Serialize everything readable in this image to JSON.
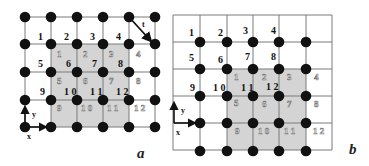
{
  "figure": {
    "panels": [
      {
        "id": "a",
        "label": "a",
        "grid_lines": {
          "x": [
            25,
            51,
            77,
            103,
            129,
            155
          ],
          "y": [
            17,
            44,
            72,
            100,
            127
          ]
        },
        "shaded_region": {
          "x0": 51,
          "y0": 44,
          "x1": 129,
          "y1": 127
        },
        "dots": {
          "x": [
            25,
            51,
            77,
            103,
            129,
            155
          ],
          "y": [
            17,
            44,
            72,
            100,
            127
          ]
        },
        "black_labels": [
          {
            "text": "1",
            "x": 38,
            "y": 40
          },
          {
            "text": "2",
            "x": 64,
            "y": 40
          },
          {
            "text": "3",
            "x": 90,
            "y": 40
          },
          {
            "text": "4",
            "x": 116,
            "y": 40
          },
          {
            "text": "5",
            "x": 38,
            "y": 67
          },
          {
            "text": "6",
            "x": 66,
            "y": 67
          },
          {
            "text": "7",
            "x": 92,
            "y": 67
          },
          {
            "text": "8",
            "x": 118,
            "y": 67
          },
          {
            "text": "9",
            "x": 40,
            "y": 95
          },
          {
            "text": "1 0",
            "x": 64,
            "y": 95
          },
          {
            "text": "1 1",
            "x": 90,
            "y": 95
          },
          {
            "text": "1 2",
            "x": 116,
            "y": 95
          }
        ],
        "gray_labels": [
          {
            "text": "1",
            "x": 57,
            "y": 57
          },
          {
            "text": "2",
            "x": 83,
            "y": 57
          },
          {
            "text": "3",
            "x": 109,
            "y": 57
          },
          {
            "text": "4",
            "x": 136,
            "y": 57
          },
          {
            "text": "5",
            "x": 57,
            "y": 84
          },
          {
            "text": "6",
            "x": 83,
            "y": 84
          },
          {
            "text": "7",
            "x": 109,
            "y": 84
          },
          {
            "text": "8",
            "x": 136,
            "y": 84
          },
          {
            "text": "9",
            "x": 57,
            "y": 111
          },
          {
            "text": "1 0",
            "x": 81,
            "y": 111
          },
          {
            "text": "1 1",
            "x": 107,
            "y": 111
          },
          {
            "text": "1 2",
            "x": 134,
            "y": 111
          }
        ],
        "translation_arrow": {
          "label": "t",
          "from": [
            129,
            17
          ],
          "to": [
            150,
            40
          ],
          "label_pos": [
            142,
            27
          ]
        },
        "axes": {
          "origin": [
            25,
            127
          ],
          "x_label": "x",
          "y_label": "y"
        },
        "panel_label_pos": [
          137,
          158
        ]
      },
      {
        "id": "b",
        "label": "b",
        "frame": {
          "x0": 173,
          "y0": 15,
          "x1": 332,
          "y1": 150
        },
        "grid_lines": {
          "x": [
            173,
            200,
            227,
            253,
            279,
            306,
            332
          ],
          "y": [
            15,
            42,
            69,
            96,
            123,
            150
          ]
        },
        "shaded_region": {
          "x0": 227,
          "y0": 69,
          "x1": 306,
          "y1": 150
        },
        "dots": {
          "x": [
            200,
            227,
            253,
            279,
            306
          ],
          "y": [
            42,
            69,
            96,
            123,
            151
          ]
        },
        "black_labels": [
          {
            "text": "1",
            "x": 189,
            "y": 36
          },
          {
            "text": "2",
            "x": 218,
            "y": 36
          },
          {
            "text": "3",
            "x": 243,
            "y": 34
          },
          {
            "text": "4",
            "x": 271,
            "y": 34
          },
          {
            "text": "5",
            "x": 189,
            "y": 61
          },
          {
            "text": "6",
            "x": 218,
            "y": 63
          },
          {
            "text": "7",
            "x": 245,
            "y": 60
          },
          {
            "text": "8",
            "x": 271,
            "y": 60
          },
          {
            "text": "9",
            "x": 190,
            "y": 91
          },
          {
            "text": "1 0",
            "x": 213,
            "y": 91
          },
          {
            "text": "1 1",
            "x": 241,
            "y": 91
          },
          {
            "text": "1 2",
            "x": 266,
            "y": 90
          }
        ],
        "gray_labels": [
          {
            "text": "1",
            "x": 234,
            "y": 80
          },
          {
            "text": "2",
            "x": 262,
            "y": 80
          },
          {
            "text": "3",
            "x": 287,
            "y": 80
          },
          {
            "text": "4",
            "x": 314,
            "y": 80
          },
          {
            "text": "5",
            "x": 234,
            "y": 106
          },
          {
            "text": "6",
            "x": 262,
            "y": 107
          },
          {
            "text": "7",
            "x": 287,
            "y": 107
          },
          {
            "text": "8",
            "x": 314,
            "y": 107
          },
          {
            "text": "9",
            "x": 235,
            "y": 134
          },
          {
            "text": "1 0",
            "x": 258,
            "y": 134
          },
          {
            "text": "1 1",
            "x": 284,
            "y": 134
          },
          {
            "text": "1 2",
            "x": 313,
            "y": 134
          }
        ],
        "axes": {
          "origin": [
            174,
            123
          ],
          "x_label": "x",
          "y_label": "y"
        },
        "panel_label_pos": [
          349,
          154
        ]
      }
    ],
    "colors": {
      "grid": "#7a7a7a",
      "shade": "#d4d4d4",
      "dot": "#111111",
      "frame": "#8a8a8a"
    }
  }
}
